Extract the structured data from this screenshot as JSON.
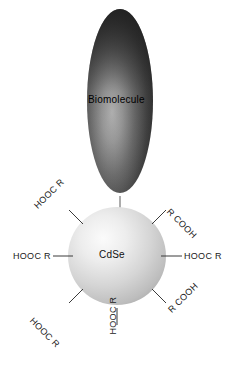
{
  "figure": {
    "background_color": "#ffffff",
    "biomolecule": {
      "label": "Biomolecule",
      "shape": "ellipse",
      "fill_dark": "#2b2b2b",
      "fill_light": "#b5b5b5"
    },
    "core": {
      "label": "CdSe",
      "shape": "sphere",
      "fill_light": "#f2f2f2",
      "fill_mid": "#c8c8c8",
      "fill_edge": "#a8a8a8"
    },
    "linker": {
      "name": "biomolecule-core-connector",
      "color": "#666666"
    },
    "ligands": [
      {
        "id": "ligand-west",
        "label": "HOOC R",
        "position": "west",
        "connector": "line"
      },
      {
        "id": "ligand-east",
        "label": "HOOC R",
        "position": "east",
        "connector": "line"
      },
      {
        "id": "ligand-northwest",
        "label": "HOOC R",
        "position": "northwest",
        "connector": "line"
      },
      {
        "id": "ligand-northeast",
        "label": "R COOH",
        "position": "northeast",
        "connector": "line"
      },
      {
        "id": "ligand-southwest",
        "label": "HOOC R",
        "position": "southwest",
        "connector": "line"
      },
      {
        "id": "ligand-southeast",
        "label": "R COOH",
        "position": "southeast",
        "connector": "line"
      },
      {
        "id": "ligand-south",
        "label": "HOOC R",
        "position": "south",
        "connector": "line"
      }
    ]
  }
}
